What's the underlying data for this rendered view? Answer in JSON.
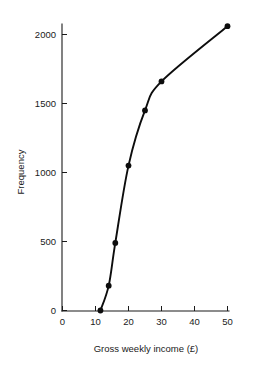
{
  "chart_data": {
    "type": "line",
    "title": "",
    "subtitle": "",
    "xlabel": "Gross weekly income (£)",
    "ylabel": "Frequency",
    "xlim": [
      0,
      50
    ],
    "ylim": [
      0,
      2200
    ],
    "xticks": [
      0,
      10,
      20,
      30,
      40,
      50
    ],
    "xtick_labels": [
      "0",
      "10",
      "20",
      "30",
      "40",
      "50"
    ],
    "yticks": [
      0,
      500,
      1000,
      1500,
      2000
    ],
    "ytick_labels": [
      "0",
      "500",
      "1000",
      "1500",
      "2000"
    ],
    "grid": false,
    "legend": null,
    "legend_position": "none",
    "marker": "filled-circle",
    "line_color": "#0d0d0d",
    "marker_color": "#0d0d0d",
    "axis_color": "#1a1a1a",
    "background_color": "#ffffff",
    "series": [
      {
        "name": "Cumulative frequency",
        "x": [
          11.5,
          14.0,
          16.0,
          20.0,
          25.0,
          30.0,
          50.0
        ],
        "values": [
          0,
          180,
          490,
          1050,
          1450,
          1660,
          2060
        ]
      }
    ],
    "annotations": []
  },
  "axis_labels": {
    "x_title": "Gross weekly income (£)",
    "y_title": "Frequency"
  },
  "x_tick_text": {
    "t0": "0",
    "t1": "10",
    "t2": "20",
    "t3": "30",
    "t4": "40",
    "t5": "50"
  },
  "y_tick_text": {
    "t0": "0",
    "t1": "500",
    "t2": "1000",
    "t3": "1500",
    "t4": "2000"
  }
}
